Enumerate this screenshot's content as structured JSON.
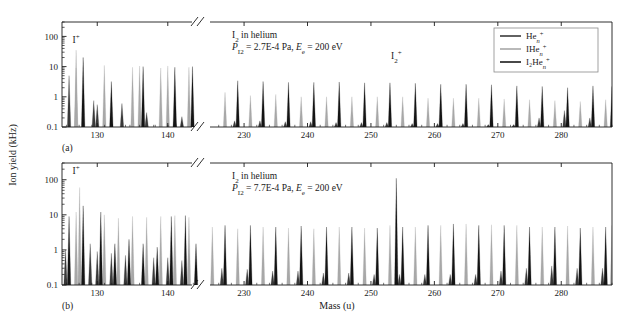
{
  "figure": {
    "type": "mass-spectrum",
    "axis_break_symbol": "//"
  },
  "axes": {
    "y_label": "Ion yield (kHz)",
    "y_ticks": [
      "0.1",
      "1",
      "10",
      "100"
    ],
    "y_scale": "log",
    "y_min": 0.1,
    "y_max": 300,
    "x_label": "Mass (u)",
    "x_ticks_left": [
      "130",
      "140"
    ],
    "x_ticks_right": [
      "230",
      "240",
      "250",
      "260",
      "270",
      "280"
    ],
    "x_left_range": [
      125,
      144
    ],
    "x_right_range": [
      224,
      288
    ]
  },
  "legend": {
    "items": [
      {
        "label": "He",
        "sub": "n",
        "sup": "+",
        "color": "#3a3a3a",
        "name": "He_n+"
      },
      {
        "label": "IHe",
        "sub": "n",
        "sup": "+",
        "color": "#a8a8a8",
        "name": "IHe_n+"
      },
      {
        "label": "I₂He",
        "sub": "n",
        "sup": "+",
        "color": "#1a1a1a",
        "name": "I2He_n+"
      }
    ]
  },
  "panels": [
    {
      "id": "a",
      "tag": "(a)",
      "title": "I₂ in helium",
      "conditions": "P₁₂ = 2.7E-4 Pa, Eₑ = 200 eV",
      "condition_parts": {
        "p_symbol": "P",
        "p_sub": "I2",
        "p_value": "= 2.7E-4 Pa,",
        "e_symbol": "E",
        "e_sub": "e",
        "e_value": "= 200 eV"
      },
      "annotations": [
        {
          "text": "I",
          "sup": "+",
          "mass": 127,
          "yield": 60,
          "name": "I-plus-label"
        },
        {
          "text": "I₂",
          "sup": "+",
          "mass": 254,
          "yield": 18,
          "name": "I2-plus-label"
        }
      ]
    },
    {
      "id": "b",
      "tag": "(b)",
      "title": "I₂ in helium",
      "conditions": "P₁₂ = 7.7E-4 Pa, Eₑ = 200 eV",
      "condition_parts": {
        "p_symbol": "P",
        "p_sub": "I2",
        "p_value": "= 7.7E-4 Pa,",
        "e_symbol": "E",
        "e_sub": "e",
        "e_value": "= 200 eV"
      },
      "annotations": [
        {
          "text": "I",
          "sup": "+",
          "mass": 127,
          "yield": 150,
          "name": "I-plus-label"
        }
      ]
    }
  ],
  "chart_data": {
    "type": "line",
    "xlabel": "Mass (u)",
    "ylabel": "Ion yield (kHz)",
    "yscale": "log",
    "ylim": [
      0.1,
      300
    ],
    "xlim_segments": [
      [
        125,
        144
      ],
      [
        224,
        288
      ]
    ],
    "legend": [
      "He_n+",
      "IHe_n+",
      "I2He_n+"
    ],
    "legend_position": "top-right",
    "grid": false,
    "panels": [
      {
        "panel": "a",
        "series": [
          {
            "name": "IHe_n+",
            "color": "#a8a8a8",
            "peaks": [
              [
                127,
                9.0
              ],
              [
                127,
                35.0
              ],
              [
                131,
                11.0
              ],
              [
                135,
                9.5
              ],
              [
                136,
                10.5
              ],
              [
                139,
                9.0
              ],
              [
                140,
                10.5
              ],
              [
                143,
                9.5
              ],
              [
                227,
                1.4
              ],
              [
                231,
                1.1
              ],
              [
                235,
                1.2
              ],
              [
                239,
                1.0
              ],
              [
                243,
                1.0
              ],
              [
                247,
                1.0
              ],
              [
                251,
                1.0
              ],
              [
                255,
                1.0
              ],
              [
                259,
                0.9
              ],
              [
                263,
                0.9
              ],
              [
                267,
                0.9
              ],
              [
                271,
                0.85
              ],
              [
                275,
                0.8
              ],
              [
                279,
                0.75
              ],
              [
                283,
                0.7
              ],
              [
                287,
                0.8
              ]
            ]
          },
          {
            "name": "He_n+",
            "color": "#3a3a3a",
            "peaks": [
              [
                126,
                5.0
              ],
              [
                129.5,
                0.75
              ],
              [
                130,
                0.55
              ],
              [
                133.5,
                0.6
              ],
              [
                137,
                0.3
              ],
              [
                141,
                0.25
              ],
              [
                142,
                0.22
              ],
              [
                228.5,
                0.16
              ],
              [
                232.5,
                0.16
              ],
              [
                236.5,
                0.15
              ],
              [
                240.5,
                0.15
              ],
              [
                244.5,
                0.14
              ],
              [
                248.5,
                0.14
              ],
              [
                252.5,
                0.14
              ],
              [
                256.5,
                0.13
              ],
              [
                260.5,
                0.13
              ],
              [
                264.5,
                0.13
              ],
              [
                268.5,
                0.12
              ],
              [
                272.5,
                0.12
              ],
              [
                276.5,
                0.2
              ],
              [
                280.5,
                0.35
              ],
              [
                284.5,
                0.2
              ]
            ]
          },
          {
            "name": "I2He_n+",
            "color": "#141414",
            "peaks": [
              [
                128,
                20.0
              ],
              [
                132,
                3.2
              ],
              [
                136.5,
                10.0
              ],
              [
                141,
                9.5
              ],
              [
                143.5,
                10.0
              ],
              [
                229,
                3.4
              ],
              [
                233,
                3.2
              ],
              [
                237,
                3.0
              ],
              [
                241,
                3.0
              ],
              [
                245,
                3.1
              ],
              [
                249,
                2.9
              ],
              [
                253,
                2.9
              ],
              [
                257,
                2.8
              ],
              [
                261,
                2.6
              ],
              [
                265,
                2.6
              ],
              [
                269,
                2.5
              ],
              [
                273,
                2.3
              ],
              [
                277,
                2.2
              ],
              [
                281,
                2.0
              ],
              [
                285,
                2.3
              ],
              [
                288,
                2.2
              ]
            ]
          }
        ]
      },
      {
        "panel": "b",
        "series": [
          {
            "name": "IHe_n+",
            "color": "#a8a8a8",
            "peaks": [
              [
                127,
                12.0
              ],
              [
                127.5,
                60.0
              ],
              [
                131,
                10.0
              ],
              [
                133,
                8.0
              ],
              [
                135,
                9.0
              ],
              [
                137,
                8.5
              ],
              [
                139,
                9.0
              ],
              [
                141,
                9.5
              ],
              [
                143,
                8.5
              ],
              [
                225,
                4.5
              ],
              [
                229,
                4.0
              ],
              [
                233,
                4.5
              ],
              [
                237,
                4.2
              ],
              [
                241,
                4.0
              ],
              [
                245,
                4.5
              ],
              [
                249,
                4.2
              ],
              [
                253,
                5.0
              ],
              [
                257,
                4.5
              ],
              [
                261,
                5.0
              ],
              [
                265,
                5.5
              ],
              [
                269,
                5.2
              ],
              [
                273,
                5.0
              ],
              [
                277,
                4.5
              ],
              [
                281,
                4.8
              ],
              [
                285,
                4.5
              ],
              [
                288,
                5.0
              ]
            ]
          },
          {
            "name": "He_n+",
            "color": "#3a3a3a",
            "peaks": [
              [
                125.5,
                1.0
              ],
              [
                129,
                1.5
              ],
              [
                130,
                0.9
              ],
              [
                132,
                0.8
              ],
              [
                134,
                0.7
              ],
              [
                138,
                0.6
              ],
              [
                140,
                0.6
              ],
              [
                142,
                0.5
              ],
              [
                226.5,
                0.3
              ],
              [
                230.5,
                0.28
              ],
              [
                234.5,
                0.25
              ],
              [
                238.5,
                0.25
              ],
              [
                242.5,
                0.22
              ],
              [
                246.5,
                0.22
              ],
              [
                250.5,
                0.2
              ],
              [
                254.5,
                0.2
              ],
              [
                258.5,
                0.2
              ],
              [
                262.5,
                0.2
              ],
              [
                266.5,
                0.2
              ],
              [
                270.5,
                0.25
              ],
              [
                274.5,
                0.3
              ],
              [
                278.5,
                0.35
              ],
              [
                282.5,
                0.3
              ],
              [
                286.5,
                0.3
              ]
            ]
          },
          {
            "name": "I2He_n+",
            "color": "#141414",
            "peaks": [
              [
                126,
                9.0
              ],
              [
                128,
                18.0
              ],
              [
                130.5,
                12.0
              ],
              [
                132.5,
                1.5
              ],
              [
                134.5,
                2.0
              ],
              [
                136.5,
                1.5
              ],
              [
                138.5,
                1.2
              ],
              [
                140.5,
                9.0
              ],
              [
                142.5,
                9.5
              ],
              [
                144,
                1.5
              ],
              [
                227,
                5.0
              ],
              [
                231,
                5.0
              ],
              [
                235,
                4.5
              ],
              [
                239,
                4.8
              ],
              [
                243,
                4.5
              ],
              [
                247,
                4.5
              ],
              [
                251,
                4.2
              ],
              [
                254,
                110.0
              ],
              [
                255,
                4.5
              ],
              [
                259,
                5.0
              ],
              [
                263,
                5.5
              ],
              [
                267,
                5.0
              ],
              [
                271,
                5.0
              ],
              [
                275,
                4.5
              ],
              [
                279,
                4.5
              ],
              [
                283,
                4.2
              ],
              [
                287,
                4.5
              ]
            ]
          }
        ]
      }
    ]
  }
}
